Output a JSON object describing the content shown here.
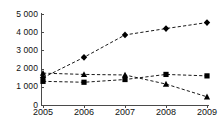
{
  "chart_data": {
    "type": "line",
    "title": "",
    "subtitle": "",
    "xlabel": "",
    "ylabel": "",
    "categories": [
      "2005",
      "2006",
      "2007",
      "2008",
      "2009"
    ],
    "x": [
      2005,
      2006,
      2007,
      2008,
      2009
    ],
    "ylim": [
      0,
      5000
    ],
    "xlim": [
      2005,
      2009
    ],
    "yticks": [
      0,
      1000,
      2000,
      3000,
      4000,
      5000
    ],
    "ytick_labels": [
      "0",
      "1 000",
      "2 000",
      "3 000",
      "4 000",
      "5 000"
    ],
    "xtick_labels": [
      "2005",
      "2006",
      "2007",
      "2008",
      "2009"
    ],
    "grid": false,
    "legend": "none",
    "line_style": "dashed",
    "series": [
      {
        "name": "series-1",
        "marker": "diamond",
        "color": "#000000",
        "values": [
          1500,
          2620,
          3850,
          4200,
          4530
        ]
      },
      {
        "name": "series-2",
        "marker": "square",
        "color": "#000000",
        "values": [
          1300,
          1250,
          1400,
          1680,
          1600
        ]
      },
      {
        "name": "series-3",
        "marker": "triangle",
        "color": "#000000",
        "values": [
          1750,
          1680,
          1650,
          1150,
          450
        ]
      }
    ]
  },
  "axes": {
    "axis_color": "#4a4a4a"
  }
}
